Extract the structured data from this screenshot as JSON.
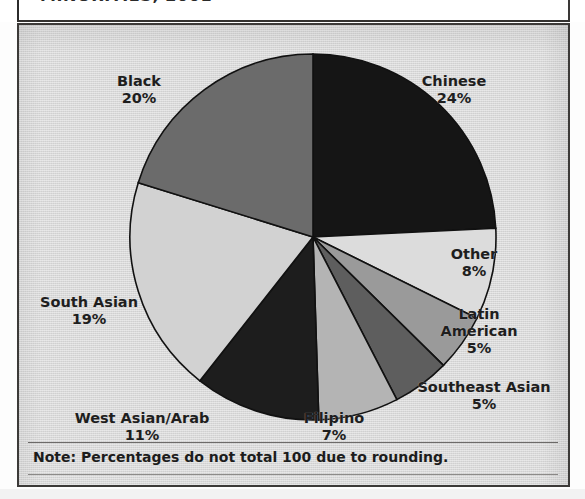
{
  "document": {
    "title": "MINORITIES, 2001",
    "title_note": "title is cropped at the top edge of the screenshot"
  },
  "note": {
    "text": "Note:  Percentages do not total 100 due to rounding."
  },
  "chart_data": {
    "type": "pie",
    "title": "MINORITIES, 2001",
    "xlabel": "",
    "ylabel": "",
    "legend_position": "none",
    "labels_outside": true,
    "start_angle_deg": 0,
    "direction": "clockwise",
    "categories": [
      "Chinese",
      "Other",
      "Latin American",
      "Southeast Asian",
      "Filipino",
      "West Asian/Arab",
      "South Asian",
      "Black"
    ],
    "values": [
      24,
      8,
      5,
      5,
      7,
      11,
      19,
      20
    ],
    "unit": "%",
    "total_shown": 99,
    "annotations": [
      "Note:  Percentages do not total 100 due to rounding."
    ],
    "slices": [
      {
        "label": "Chinese",
        "value": 24,
        "value_text": "24%",
        "color": "#151515"
      },
      {
        "label": "Other",
        "value": 8,
        "value_text": "8%",
        "color": "#dcdcdc"
      },
      {
        "label": "Latin American",
        "value": 5,
        "value_text": "5%",
        "color": "#9a9a9a"
      },
      {
        "label": "Southeast Asian",
        "value": 5,
        "value_text": "5%",
        "color": "#5e5e5e"
      },
      {
        "label": "Filipino",
        "value": 7,
        "value_text": "7%",
        "color": "#b4b4b4"
      },
      {
        "label": "West Asian/Arab",
        "value": 11,
        "value_text": "11%",
        "color": "#1d1d1d"
      },
      {
        "label": "South Asian",
        "value": 19,
        "value_text": "19%",
        "color": "#d2d2d2"
      },
      {
        "label": "Black",
        "value": 20,
        "value_text": "20%",
        "color": "#6b6b6b"
      }
    ]
  },
  "labels": {
    "chinese": {
      "name": "Chinese",
      "value": "24%"
    },
    "black": {
      "name": "Black",
      "value": "20%"
    },
    "south_asian": {
      "name": "South Asian",
      "value": "19%"
    },
    "west_asian_arab": {
      "name": "West Asian/Arab",
      "value": "11%"
    },
    "filipino": {
      "name": "Filipino",
      "value": "7%"
    },
    "southeast_asian": {
      "name": "Southeast Asian",
      "value": "5%"
    },
    "latin_american": {
      "name": "Latin",
      "name2": "American",
      "value": "5%"
    },
    "other": {
      "name": "Other",
      "value": "8%"
    }
  },
  "colors": {
    "panel_background": "#d9d9d9",
    "frame": "#3c3a38",
    "text": "#1e1e1e",
    "slice_outline": "#111111"
  }
}
